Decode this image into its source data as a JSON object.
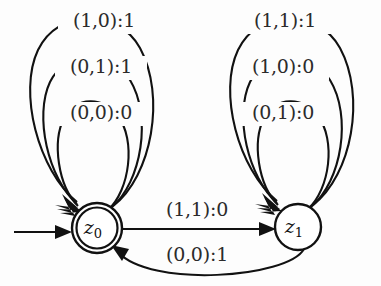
{
  "diagram": {
    "type": "finite-state-machine",
    "background_color": "#fdfdfd",
    "line_color": "#111111",
    "states": [
      {
        "id": "z0",
        "label": "z",
        "subscript": "0",
        "shape": "double-circle",
        "is_initial": true,
        "is_accepting": true,
        "cx": 97,
        "cy": 228,
        "r_outer": 25,
        "r_inner": 20.5
      },
      {
        "id": "z1",
        "label": "z",
        "subscript": "1",
        "shape": "circle",
        "is_initial": false,
        "is_accepting": false,
        "cx": 298,
        "cy": 227,
        "r_outer": 23,
        "r_inner": 0
      }
    ],
    "self_loops_z0": [
      {
        "label": "(1,0):1",
        "input": "(1,0)",
        "output": "1",
        "ring": "outer",
        "label_x": 104,
        "label_y": 22
      },
      {
        "label": "(0,1):1",
        "input": "(0,1)",
        "output": "1",
        "ring": "middle",
        "label_x": 101,
        "label_y": 68
      },
      {
        "label": "(0,0):0",
        "input": "(0,0)",
        "output": "0",
        "ring": "inner",
        "label_x": 101,
        "label_y": 114
      }
    ],
    "self_loops_z1": [
      {
        "label": "(1,1):1",
        "input": "(1,1)",
        "output": "1",
        "ring": "outer",
        "label_x": 285,
        "label_y": 22
      },
      {
        "label": "(1,0):0",
        "input": "(1,0)",
        "output": "0",
        "ring": "middle",
        "label_x": 283,
        "label_y": 68
      },
      {
        "label": "(0,1):0",
        "input": "(0,1)",
        "output": "0",
        "ring": "inner",
        "label_x": 283,
        "label_y": 114
      }
    ],
    "transitions": [
      {
        "id": "z0-to-z1",
        "from": "z0",
        "to": "z1",
        "label": "(1,1):0",
        "input": "(1,1)",
        "output": "0",
        "label_x": 197,
        "label_y": 211,
        "style": "straight"
      },
      {
        "id": "z1-to-z0",
        "from": "z1",
        "to": "z0",
        "label": "(0,0):1",
        "input": "(0,0)",
        "output": "1",
        "label_x": 197,
        "label_y": 256,
        "style": "curved"
      }
    ],
    "start_arrow": {
      "name": "initial-state-arrow",
      "from_x": 14,
      "to_x": 70,
      "y": 232
    }
  }
}
